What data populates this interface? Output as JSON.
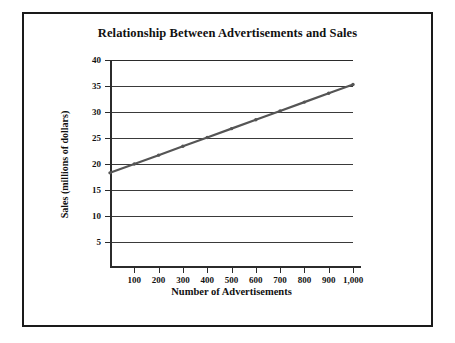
{
  "chart_data": {
    "type": "line",
    "title": "Relationship Between Advertisements and Sales",
    "xlabel": "Number of Advertisements",
    "ylabel": "Sales (millions of dollars)",
    "x": [
      0,
      100,
      200,
      300,
      400,
      500,
      600,
      700,
      800,
      900,
      1000
    ],
    "values": [
      18.3,
      20.0,
      21.7,
      23.4,
      25.1,
      26.8,
      28.5,
      30.2,
      31.9,
      33.6,
      35.3
    ],
    "series": [
      {
        "name": "Sales",
        "values": [
          18.3,
          20.0,
          21.7,
          23.4,
          25.1,
          26.8,
          28.5,
          30.2,
          31.9,
          33.6,
          35.3
        ]
      }
    ],
    "xlim": [
      0,
      1000
    ],
    "ylim": [
      0,
      40
    ],
    "xtick_labels": [
      "100",
      "200",
      "300",
      "400",
      "500",
      "600",
      "700",
      "800",
      "900",
      "1,000"
    ],
    "xticks": [
      100,
      200,
      300,
      400,
      500,
      600,
      700,
      800,
      900,
      1000
    ],
    "ytick_labels": [
      "5",
      "10",
      "15",
      "20",
      "25",
      "30",
      "35",
      "40"
    ],
    "yticks": [
      5,
      10,
      15,
      20,
      25,
      30,
      35,
      40
    ],
    "grid": "horizontal",
    "legend": "none",
    "line_color": "#555555",
    "axis_color": "#2b2b2b",
    "grid_color": "#3a3a3a",
    "background_color": "#ffffff",
    "border_color": "#1a1a1a"
  }
}
